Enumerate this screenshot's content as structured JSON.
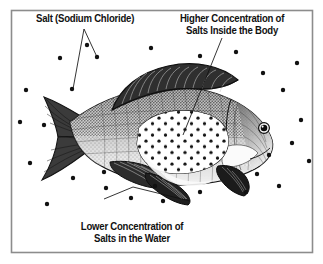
{
  "figure": {
    "kind": "biology-illustration",
    "frame_color": "#8c8c8c",
    "background_color": "#ffffff",
    "ink_color": "#1a1a1a",
    "labels": {
      "salt": {
        "name": "salt-label",
        "line1": "Salt (Sodium Chloride)"
      },
      "higher": {
        "name": "higher-concentration-label",
        "line1": "Higher Concentration of",
        "line2": "Salts Inside the Body"
      },
      "lower": {
        "name": "lower-concentration-label",
        "line1": "Lower Concentration of",
        "line2": "Salts in the Water"
      }
    },
    "elements": {
      "fish": "fish-illustration",
      "eye": "fish-eye",
      "dorsal_fin": "dorsal-fin",
      "caudal_fin": "caudal-tail-fin",
      "pectoral_fin": "pectoral-fin",
      "pelvic_fin": "pelvic-fin",
      "anal_fin": "anal-fin",
      "body_salt_patch": "interior-salt-concentration-patch",
      "water_salt_dots": "water-salt-particles",
      "leader_salt": "salt-leader-line",
      "leader_higher": "higher-concentration-leader-line",
      "leader_lower": "lower-concentration-leader-line"
    },
    "water_dots": [
      [
        26,
        90
      ],
      [
        44,
        125
      ],
      [
        30,
        163
      ],
      [
        73,
        178
      ],
      [
        60,
        58
      ],
      [
        90,
        45
      ],
      [
        72,
        90
      ],
      [
        96,
        57
      ],
      [
        151,
        48
      ],
      [
        200,
        56
      ],
      [
        236,
        52
      ],
      [
        263,
        73
      ],
      [
        283,
        90
      ],
      [
        296,
        63
      ],
      [
        300,
        120
      ],
      [
        292,
        142
      ],
      [
        268,
        155
      ],
      [
        257,
        173
      ],
      [
        278,
        186
      ],
      [
        246,
        191
      ],
      [
        232,
        172
      ],
      [
        200,
        191
      ],
      [
        163,
        200
      ],
      [
        131,
        198
      ],
      [
        106,
        187
      ],
      [
        104,
        172
      ],
      [
        154,
        185
      ],
      [
        253,
        131
      ],
      [
        309,
        161
      ],
      [
        47,
        204
      ],
      [
        20,
        122
      ]
    ],
    "body_dots_note": "grid of salt particles inside the pale body patch"
  }
}
